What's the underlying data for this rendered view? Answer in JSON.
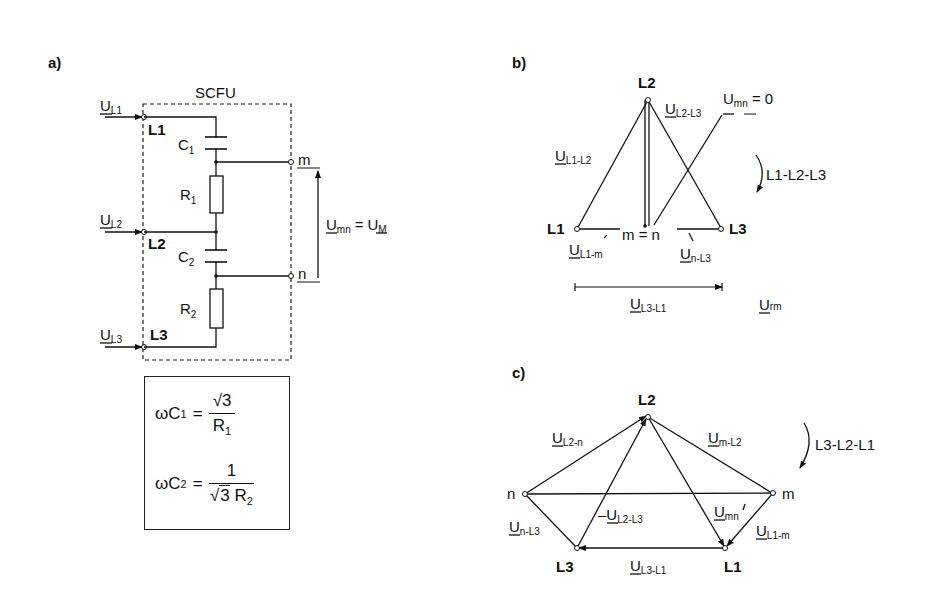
{
  "panels": {
    "a": {
      "label": "a)",
      "box_title": "SCFU",
      "inputs": [
        {
          "voltage": "U",
          "voltage_sub": "L1",
          "terminal": "L1"
        },
        {
          "voltage": "U",
          "voltage_sub": "L2",
          "terminal": "L2"
        },
        {
          "voltage": "U",
          "voltage_sub": "L3",
          "terminal": "L3"
        }
      ],
      "components": [
        {
          "name": "C",
          "sub": "1"
        },
        {
          "name": "R",
          "sub": "1"
        },
        {
          "name": "C",
          "sub": "2"
        },
        {
          "name": "R",
          "sub": "2"
        }
      ],
      "outputs": {
        "m": "m",
        "n": "n"
      },
      "measurement": {
        "lhs": "U",
        "lhs_sub": "mn",
        "eq": "=",
        "rhs": "U",
        "rhs_sub": "M"
      },
      "formulas": [
        {
          "lhs": "ωC",
          "lhs_sub": "1",
          "eq": "=",
          "num": "√3",
          "den": "R",
          "den_sub": "1"
        },
        {
          "lhs": "ωC",
          "lhs_sub": "2",
          "eq": "=",
          "num": "1",
          "den_root": "3",
          "den": "R",
          "den_sub": "2"
        }
      ]
    },
    "b": {
      "label": "b)",
      "nodes": {
        "L1": "L1",
        "L2": "L2",
        "L3": "L3",
        "mn": "m = n"
      },
      "labels": {
        "u_l1_l2": {
          "main": "U",
          "sub": "L1-L2"
        },
        "u_l2_l3": {
          "main": "U",
          "sub": "L2-L3"
        },
        "u_mn": {
          "main": "U",
          "sub": "mn",
          "suffix": " = 0"
        },
        "u_l1_m": {
          "main": "U",
          "sub": "L1-m"
        },
        "u_n_l3": {
          "main": "U",
          "sub": "n-L3"
        },
        "u_l3_l1": {
          "main": "U",
          "sub": "L3-L1"
        },
        "u_rm": {
          "main": "U",
          "sub": "rm"
        }
      },
      "rotation": "L1-L2-L3"
    },
    "c": {
      "label": "c)",
      "nodes": {
        "L1": "L1",
        "L2": "L2",
        "L3": "L3",
        "n": "n",
        "m": "m"
      },
      "labels": {
        "u_l2_n": {
          "main": "U",
          "sub": "L2-n"
        },
        "u_m_l2": {
          "main": "U",
          "sub": "m-L2"
        },
        "neg_u_l2_l3": {
          "prefix": "–",
          "main": "U",
          "sub": "L2-L3"
        },
        "u_mn": {
          "main": "U",
          "sub": "mn"
        },
        "u_n_l3": {
          "main": "U",
          "sub": "n-L3"
        },
        "u_l1_m": {
          "main": "U",
          "sub": "L1-m"
        },
        "u_l3_l1": {
          "main": "U",
          "sub": "L3-L1"
        }
      },
      "rotation": "L3-L2-L1"
    }
  }
}
